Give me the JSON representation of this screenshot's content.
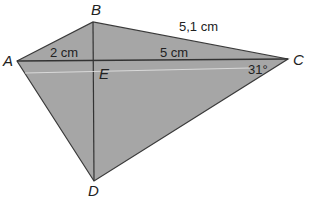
{
  "diagram": {
    "title": "",
    "points": {
      "A": "A",
      "B": "B",
      "C": "C",
      "D": "D",
      "E": "E"
    },
    "measurements": {
      "AE": "2 cm",
      "EC": "5 cm",
      "BC": "5,1 cm",
      "angle_C": "31°"
    },
    "colors": {
      "fill": "#a6a6a6",
      "stroke": "#3a3a3a",
      "text": "#222222"
    }
  }
}
